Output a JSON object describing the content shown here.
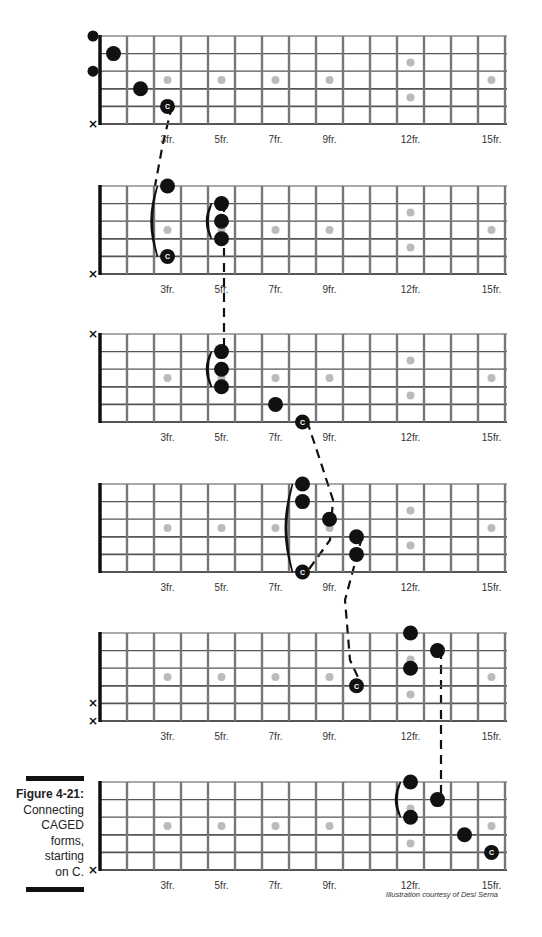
{
  "figure": {
    "title": "Figure 4-21:",
    "caption_lines": [
      "Connecting",
      "CAGED",
      "forms,",
      "starting",
      "on C."
    ],
    "credit": "Illustration courtesy of Desi Serna"
  },
  "layout": {
    "nut_x": 100,
    "fret_spacing": 27,
    "num_frets": 15,
    "string_spacing": 17.6,
    "fret_labels": [
      {
        "fret": 3,
        "label": "3fr."
      },
      {
        "fret": 5,
        "label": "5fr."
      },
      {
        "fret": 7,
        "label": "7fr."
      },
      {
        "fret": 9,
        "label": "9fr."
      },
      {
        "fret": 12,
        "label": "12fr."
      },
      {
        "fret": 15,
        "label": "15fr."
      }
    ],
    "inlays_single": [
      3,
      5,
      7,
      9,
      15
    ],
    "inlay_double": 12,
    "colors": {
      "fret": "#777777",
      "string": "#555555",
      "nut": "#111111",
      "dot": "#111111",
      "inlay": "#bbbbbb",
      "label": "#333333"
    }
  },
  "diagrams": [
    {
      "name": "C-form",
      "top": 36,
      "muted_strings": [
        6
      ],
      "notes": [
        {
          "string": 1,
          "fret": 0,
          "open": true
        },
        {
          "string": 2,
          "fret": 1
        },
        {
          "string": 3,
          "fret": 0,
          "open": true
        },
        {
          "string": 4,
          "fret": 2
        },
        {
          "string": 5,
          "fret": 3,
          "root": true,
          "label": "C"
        }
      ],
      "barres": []
    },
    {
      "name": "A-form",
      "top": 186,
      "muted_strings": [
        6
      ],
      "notes": [
        {
          "string": 1,
          "fret": 3
        },
        {
          "string": 5,
          "fret": 3,
          "root": true,
          "label": "C"
        },
        {
          "string": 2,
          "fret": 5
        },
        {
          "string": 3,
          "fret": 5
        },
        {
          "string": 4,
          "fret": 5
        }
      ],
      "barres": [
        {
          "fret": 3,
          "from": 1,
          "to": 5
        },
        {
          "fret": 5,
          "from": 2,
          "to": 4
        }
      ]
    },
    {
      "name": "G-form",
      "top": 334,
      "muted_strings": [
        1
      ],
      "notes": [
        {
          "string": 2,
          "fret": 5
        },
        {
          "string": 3,
          "fret": 5
        },
        {
          "string": 4,
          "fret": 5
        },
        {
          "string": 5,
          "fret": 7
        },
        {
          "string": 6,
          "fret": 8,
          "root": true,
          "label": "C"
        }
      ],
      "barres": [
        {
          "fret": 5,
          "from": 2,
          "to": 4
        }
      ]
    },
    {
      "name": "E-form",
      "top": 484,
      "muted_strings": [],
      "notes": [
        {
          "string": 1,
          "fret": 8
        },
        {
          "string": 2,
          "fret": 8
        },
        {
          "string": 3,
          "fret": 9
        },
        {
          "string": 4,
          "fret": 10
        },
        {
          "string": 5,
          "fret": 10
        },
        {
          "string": 6,
          "fret": 8,
          "root": true,
          "label": "C"
        }
      ],
      "barres": [
        {
          "fret": 8,
          "from": 1,
          "to": 6
        }
      ]
    },
    {
      "name": "D-form",
      "top": 633,
      "muted_strings": [
        5,
        6
      ],
      "notes": [
        {
          "string": 1,
          "fret": 12
        },
        {
          "string": 2,
          "fret": 13
        },
        {
          "string": 3,
          "fret": 12
        },
        {
          "string": 4,
          "fret": 10,
          "root": true,
          "label": "C"
        }
      ],
      "barres": []
    },
    {
      "name": "C-form-octave",
      "top": 782,
      "muted_strings": [
        6
      ],
      "notes": [
        {
          "string": 1,
          "fret": 12
        },
        {
          "string": 2,
          "fret": 13
        },
        {
          "string": 3,
          "fret": 12
        },
        {
          "string": 4,
          "fret": 14
        },
        {
          "string": 5,
          "fret": 15,
          "root": true,
          "label": "C"
        }
      ],
      "barres": [
        {
          "fret": 12,
          "from": 1,
          "to": 3
        }
      ]
    }
  ],
  "connectors": [
    {
      "points": [
        [
          172,
          106
        ],
        [
          163,
          143
        ],
        [
          155,
          186
        ]
      ]
    },
    {
      "points": [
        [
          224,
          203
        ],
        [
          224,
          280
        ],
        [
          224,
          350
        ]
      ]
    },
    {
      "points": [
        [
          307,
          421
        ],
        [
          320,
          460
        ],
        [
          333,
          500
        ],
        [
          330,
          540
        ],
        [
          307,
          572
        ]
      ]
    },
    {
      "points": [
        [
          362,
          537
        ],
        [
          345,
          600
        ],
        [
          350,
          660
        ],
        [
          362,
          686
        ]
      ]
    },
    {
      "points": [
        [
          441,
          650
        ],
        [
          441,
          720
        ],
        [
          441,
          799
        ]
      ]
    }
  ]
}
